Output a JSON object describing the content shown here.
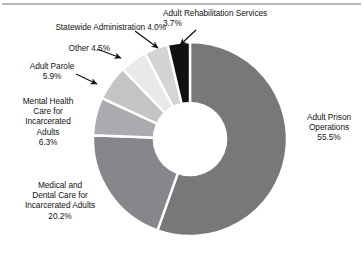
{
  "figure": {
    "has_top_rule": true,
    "background": "#ffffff"
  },
  "chart_data": {
    "type": "pie",
    "variant": "donut",
    "title": "",
    "subtitle": "",
    "xlabel": "",
    "ylabel": "",
    "legend_position": "none",
    "labels_inline": true,
    "units": "percent",
    "total": 100.1,
    "start_angle_deg": 0,
    "direction": "clockwise",
    "inner_radius_ratio": 0.385,
    "categories": [
      "Adult Prison Operations",
      "Medical and Dental Care for Incarcerated Adults",
      "Mental Health Care for Incarcerated Adults",
      "Adult Parole",
      "Other",
      "Statewide Administration",
      "Adult Rehabilitation Services"
    ],
    "values": [
      55.5,
      20.2,
      6.3,
      5.9,
      4.5,
      4.0,
      3.7
    ],
    "value_labels": [
      "55.5%",
      "20.2%",
      "6.3%",
      "5.9%",
      "4.5%",
      "4.0%",
      "3.7%"
    ],
    "colors": [
      "#77787a",
      "#85878b",
      "#a9abae",
      "#c2c4c6",
      "#e8e9ea",
      "#d3d4d6",
      "#111111"
    ],
    "slice_gap_color": "#ffffff",
    "slices": [
      {
        "name": "Adult Prison Operations",
        "value": 55.5,
        "label": "55.5%",
        "color": "#77787a"
      },
      {
        "name": "Medical and Dental Care for Incarcerated Adults",
        "value": 20.2,
        "label": "20.2%",
        "color": "#85878b"
      },
      {
        "name": "Mental Health Care for Incarcerated Adults",
        "value": 6.3,
        "label": "6.3%",
        "color": "#a9abae"
      },
      {
        "name": "Adult Parole",
        "value": 5.9,
        "label": "5.9%",
        "color": "#c2c4c6"
      },
      {
        "name": "Other",
        "value": 4.5,
        "label": "4.5%",
        "color": "#e8e9ea"
      },
      {
        "name": "Statewide Administration",
        "value": 4.0,
        "label": "4.0%",
        "color": "#d3d4d6"
      },
      {
        "name": "Adult Rehabilitation Services",
        "value": 3.7,
        "label": "3.7%",
        "color": "#111111"
      }
    ]
  },
  "labels": {
    "statewide": "Statewide Administration 4.0%",
    "rehab": "Adult Rehabilitation Services\n3.7%",
    "other": "Other 4.5%",
    "parole": "Adult Parole\n5.9%",
    "mental": "Mental Health\nCare for\nIncarcerated\nAdults\n6.3%",
    "medical": "Medical and\nDental Care for\nIncarcerated Adults\n20.2%",
    "prison": "Adult Prison\nOperations\n55.5%"
  },
  "callouts": [
    {
      "name": "statewide-arrow",
      "from_label": "statewide"
    },
    {
      "name": "other-arrow",
      "from_label": "other"
    },
    {
      "name": "parole-arrow",
      "from_label": "parole"
    },
    {
      "name": "rehab-arrow",
      "from_label": "rehab"
    }
  ]
}
